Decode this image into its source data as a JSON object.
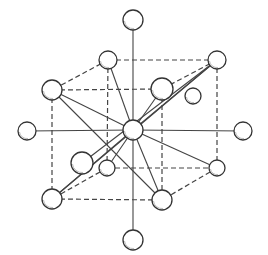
{
  "diagram": {
    "type": "crystal-lattice",
    "colors": {
      "stroke": "#333333",
      "fill": "#ffffff",
      "shade": "#bbbbbb"
    },
    "center": {
      "x": 133,
      "y": 130,
      "r": 10
    },
    "axial_atoms": [
      {
        "id": "top",
        "x": 133,
        "y": 20,
        "r": 10
      },
      {
        "id": "bottom",
        "x": 133,
        "y": 240,
        "r": 10
      },
      {
        "id": "left",
        "x": 27,
        "y": 131,
        "r": 9
      },
      {
        "id": "right",
        "x": 243,
        "y": 131,
        "r": 9
      }
    ],
    "corner_atoms": [
      {
        "id": "back-top-left",
        "x": 108,
        "y": 60,
        "r": 9
      },
      {
        "id": "back-top-right",
        "x": 217,
        "y": 60,
        "r": 9
      },
      {
        "id": "front-top-left",
        "x": 52,
        "y": 90,
        "r": 10
      },
      {
        "id": "front-top-right",
        "x": 162,
        "y": 89,
        "r": 11
      },
      {
        "id": "back-bottom-left",
        "x": 107,
        "y": 168,
        "r": 8
      },
      {
        "id": "back-bottom-right",
        "x": 217,
        "y": 168,
        "r": 8
      },
      {
        "id": "front-bottom-left",
        "x": 52,
        "y": 199,
        "r": 10
      },
      {
        "id": "front-bottom-right",
        "x": 162,
        "y": 200,
        "r": 10
      }
    ],
    "extra_atoms": [
      {
        "id": "front-left-mid",
        "x": 82,
        "y": 163,
        "r": 11
      },
      {
        "id": "back-right-mid",
        "x": 193,
        "y": 96,
        "r": 8
      }
    ]
  }
}
